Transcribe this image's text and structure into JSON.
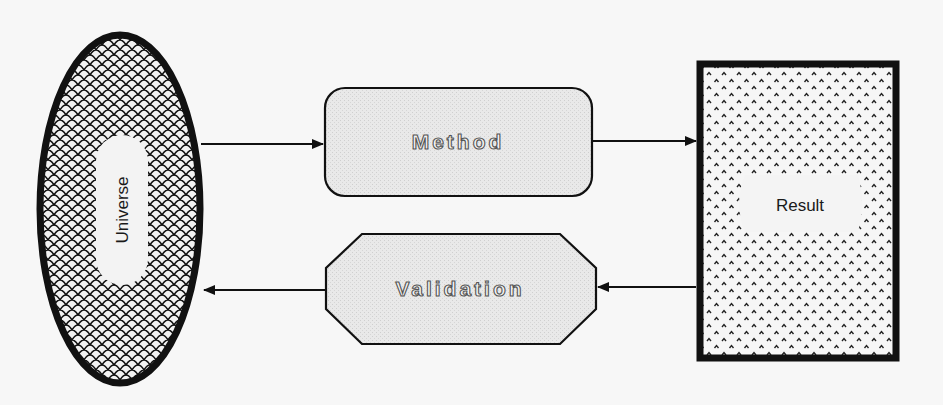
{
  "diagram": {
    "nodes": {
      "universe": {
        "label": "Universe",
        "shape": "ellipse",
        "fill_pattern": "scales"
      },
      "method": {
        "label": "Method",
        "shape": "rounded-rectangle",
        "fill_pattern": "fine-stipple"
      },
      "validation": {
        "label": "Validation",
        "shape": "octagon",
        "fill_pattern": "fine-stipple"
      },
      "result": {
        "label": "Result",
        "shape": "rectangle",
        "fill_pattern": "caret-dots"
      }
    },
    "edges": [
      {
        "from": "Universe",
        "to": "Method"
      },
      {
        "from": "Method",
        "to": "Result"
      },
      {
        "from": "Result",
        "to": "Validation"
      },
      {
        "from": "Validation",
        "to": "Universe"
      }
    ],
    "colors": {
      "background": "#f7f7f7",
      "stroke": "#111111",
      "box_fill": "#e6e6e6",
      "label_bg": "#f3f3f3"
    }
  }
}
